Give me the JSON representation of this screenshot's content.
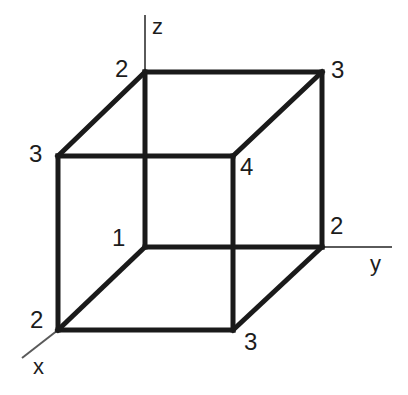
{
  "figure": {
    "background_color": "#ffffff",
    "stroke_color": "#1a1a1a",
    "axis_color": "#5a5a5a",
    "cube_stroke_width": 5,
    "axis_stroke_width": 2
  },
  "axes": [
    {
      "id": "x",
      "label": "x",
      "label_x": 33,
      "label_y": 356,
      "line": {
        "x1": 58,
        "y1": 330,
        "x2": 22,
        "y2": 358
      }
    },
    {
      "id": "y",
      "label": "y",
      "label_x": 370,
      "label_y": 253,
      "line": {
        "x1": 322,
        "y1": 247,
        "x2": 392,
        "y2": 247
      }
    },
    {
      "id": "z",
      "label": "z",
      "label_x": 152,
      "label_y": 16,
      "line": {
        "x1": 145,
        "y1": 72,
        "x2": 145,
        "y2": 15
      }
    }
  ],
  "cube": {
    "front_face": {
      "left": 58,
      "top": 156,
      "right": 233,
      "bottom": 330
    },
    "back_face": {
      "left": 145,
      "top": 72,
      "right": 322,
      "bottom": 247
    },
    "vertices": [
      {
        "name": "back-top-left",
        "value": "2",
        "px": 145,
        "py": 72,
        "label_x": 115,
        "label_y": 57
      },
      {
        "name": "back-top-right",
        "value": "3",
        "px": 322,
        "py": 72,
        "label_x": 331,
        "label_y": 58
      },
      {
        "name": "front-top-left",
        "value": "3",
        "px": 58,
        "py": 156,
        "label_x": 29,
        "label_y": 142
      },
      {
        "name": "front-top-right",
        "value": "4",
        "px": 233,
        "py": 156,
        "label_x": 240,
        "label_y": 155
      },
      {
        "name": "back-bottom-left",
        "value": "1",
        "px": 145,
        "py": 247,
        "label_x": 112,
        "label_y": 226
      },
      {
        "name": "back-bottom-right",
        "value": "2",
        "px": 322,
        "py": 247,
        "label_x": 330,
        "label_y": 214
      },
      {
        "name": "front-bottom-left",
        "value": "2",
        "px": 58,
        "py": 330,
        "label_x": 30,
        "label_y": 308
      },
      {
        "name": "front-bottom-right",
        "value": "3",
        "px": 233,
        "py": 330,
        "label_x": 244,
        "label_y": 330
      }
    ]
  }
}
